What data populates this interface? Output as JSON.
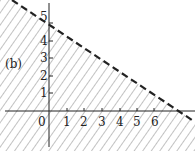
{
  "label": "(b)",
  "x_ticks": [
    "0",
    "1",
    "2",
    "3",
    "4",
    "5",
    "6"
  ],
  "y_ticks": [
    "1",
    "2",
    "3",
    "4",
    "5"
  ],
  "line": {
    "x_intercept": 6,
    "y_intercept": 4,
    "style": "dashed"
  },
  "region": "below line, hatched",
  "colors": {
    "ink": "#222222",
    "hatch": "#555555"
  }
}
